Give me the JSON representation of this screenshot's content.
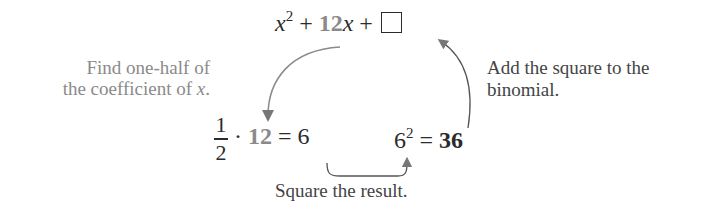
{
  "top_expression": {
    "x_term": "x",
    "x_exp": "2",
    "plus1": "+",
    "coef": "12",
    "x2": "x",
    "plus2": "+",
    "blank": "□"
  },
  "left_note": {
    "line1": "Find one-half of",
    "line2_prefix": "the coefficient of ",
    "line2_var": "x",
    "line2_suffix": "."
  },
  "right_note": {
    "line1": "Add the square to the",
    "line2": "binomial."
  },
  "half_expression": {
    "numerator": "1",
    "denominator": "2",
    "dot": "·",
    "coef": "12",
    "equals": "=",
    "result": "6"
  },
  "square_expression": {
    "base": "6",
    "exp": "2",
    "equals": "=",
    "result": "36"
  },
  "bottom_note": "Square the result.",
  "colors": {
    "text": "#2b2b2b",
    "highlight": "#8a8a8a",
    "arrow": "#777777"
  }
}
